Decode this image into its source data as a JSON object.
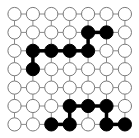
{
  "puzzle": {
    "rows": 7,
    "cols": 7,
    "colors": {
      "background": "#ffffff",
      "grid_line": "#8a8a8a",
      "cell_outline": "#7a7a7a",
      "cell_empty": "#ffffff",
      "cell_filled": "#000000",
      "path_line": "#000000"
    },
    "filled_cells": [
      [
        1,
        4
      ],
      [
        1,
        5
      ],
      [
        2,
        1
      ],
      [
        2,
        2
      ],
      [
        2,
        3
      ],
      [
        2,
        4
      ],
      [
        3,
        1
      ],
      [
        5,
        3
      ],
      [
        5,
        4
      ],
      [
        5,
        5
      ],
      [
        6,
        2
      ],
      [
        6,
        3
      ],
      [
        6,
        5
      ],
      [
        6,
        6
      ]
    ],
    "path_segments": [
      [
        [
          1,
          4
        ],
        [
          1,
          5
        ]
      ],
      [
        [
          1,
          4
        ],
        [
          2,
          4
        ]
      ],
      [
        [
          2,
          1
        ],
        [
          2,
          2
        ]
      ],
      [
        [
          2,
          2
        ],
        [
          2,
          3
        ]
      ],
      [
        [
          2,
          3
        ],
        [
          2,
          4
        ]
      ],
      [
        [
          2,
          1
        ],
        [
          3,
          1
        ]
      ],
      [
        [
          5,
          3
        ],
        [
          5,
          4
        ]
      ],
      [
        [
          5,
          4
        ],
        [
          5,
          5
        ]
      ],
      [
        [
          5,
          3
        ],
        [
          6,
          3
        ]
      ],
      [
        [
          5,
          5
        ],
        [
          6,
          5
        ]
      ],
      [
        [
          6,
          2
        ],
        [
          6,
          3
        ]
      ],
      [
        [
          6,
          5
        ],
        [
          6,
          6
        ]
      ]
    ]
  }
}
